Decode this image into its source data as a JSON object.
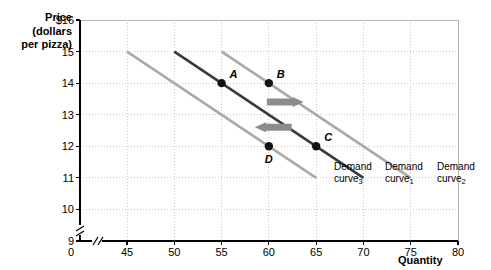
{
  "chart_data": {
    "type": "line",
    "title": "",
    "ylabel": "Price (dollars per pizza)",
    "xlabel": "Quantity",
    "ylim": [
      9,
      16
    ],
    "xlim": [
      45,
      80
    ],
    "yticks": [
      "$16",
      "15",
      "14",
      "13",
      "12",
      "11",
      "10",
      "9"
    ],
    "ytick_values": [
      16,
      15,
      14,
      13,
      12,
      11,
      10,
      9
    ],
    "xticks": [
      "45",
      "50",
      "55",
      "60",
      "65",
      "70",
      "75",
      "80"
    ],
    "xtick_values": [
      45,
      50,
      55,
      60,
      65,
      70,
      75,
      80
    ],
    "origin_label": "0",
    "axis_break": true,
    "grid": true,
    "legend_position": "inline-right",
    "series": [
      {
        "name": "Demand curve",
        "subscript": "3",
        "color": "#aaaaaa",
        "x": [
          45,
          65
        ],
        "y": [
          15,
          11
        ],
        "label_line1": "Demand",
        "label_line2": "curve"
      },
      {
        "name": "Demand curve",
        "subscript": "1",
        "color": "#3a3a3a",
        "x": [
          50,
          70
        ],
        "y": [
          15,
          11
        ],
        "label_line1": "Demand",
        "label_line2": "curve"
      },
      {
        "name": "Demand curve",
        "subscript": "2",
        "color": "#aaaaaa",
        "x": [
          55,
          75
        ],
        "y": [
          15,
          11
        ],
        "label_line1": "Demand",
        "label_line2": "curve"
      }
    ],
    "points": [
      {
        "label": "A",
        "x": 55,
        "y": 14,
        "on_curve": "1"
      },
      {
        "label": "B",
        "x": 60,
        "y": 14,
        "on_curve": "2"
      },
      {
        "label": "C",
        "x": 65,
        "y": 12,
        "on_curve": "1"
      },
      {
        "label": "D",
        "x": 60,
        "y": 12,
        "on_curve": "3"
      }
    ],
    "annotations": [
      {
        "name": "shift-right-arrow",
        "direction": "right",
        "x_from": 60,
        "x_to": 62.2,
        "y": 13.4
      },
      {
        "name": "shift-left-arrow",
        "direction": "left",
        "x_from": 62.2,
        "x_to": 60,
        "y": 12.6
      }
    ],
    "colors": {
      "curve_dark": "#3a3a3a",
      "curve_light": "#aaaaaa",
      "arrow": "#8c8c8c",
      "grid": "#c8c8c8",
      "axis": "#000000",
      "point": "#111111"
    }
  }
}
